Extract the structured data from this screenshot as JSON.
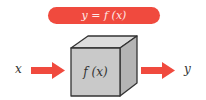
{
  "title_pill": {
    "text": "y = f (x)",
    "color": "#f04a3e"
  },
  "input_label": "x",
  "output_label": "y",
  "box_label": "f (x)",
  "colors": {
    "arrow": "#f04a3e",
    "box_front": "#c9c9c9",
    "box_top": "#dcdcdc",
    "box_side": "#b4b4b4",
    "outline": "#333333"
  }
}
